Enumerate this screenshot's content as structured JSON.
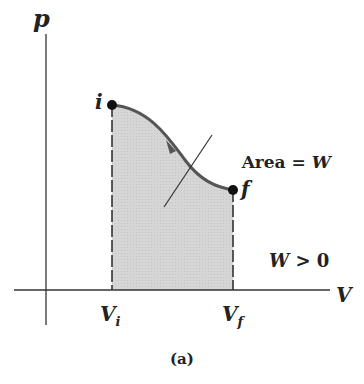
{
  "figure": {
    "axis_y_label": "p",
    "axis_x_label": "V",
    "point_initial": "i",
    "point_final": "f",
    "vi_label": "V",
    "vi_sub": "i",
    "vf_label": "V",
    "vf_sub": "f",
    "area_text": "Area = ",
    "area_var": "W",
    "condition_var": "W",
    "condition_rest": " > 0",
    "caption": "(a)",
    "fill_color": "#d4d4d4",
    "curve_color": "#555555"
  }
}
